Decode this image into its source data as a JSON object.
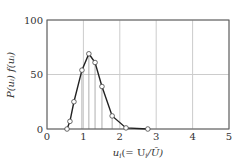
{
  "chart_data": {
    "type": "line",
    "title": "",
    "xlabel": "u_i (= U_i / Ū)",
    "ylabel": "P(u_i) f(u_i)",
    "xlim": [
      0,
      5
    ],
    "ylim": [
      0,
      100
    ],
    "xticks": [
      "0",
      "1",
      "2",
      "3",
      "4",
      "5"
    ],
    "yticks": [
      "0",
      "50",
      "100"
    ],
    "grid": true,
    "legend": null,
    "series": [
      {
        "name": "P(u_i) f(u_i)",
        "marker": "open-circle",
        "x": [
          0.55,
          0.63,
          0.74,
          0.96,
          1.15,
          1.32,
          1.51,
          1.79,
          2.17,
          2.77
        ],
        "y": [
          0,
          7,
          25,
          54,
          69,
          61,
          39,
          12,
          1,
          0
        ]
      }
    ],
    "drop_lines_x": [
      0.96,
      1.15,
      1.32,
      1.51,
      1.79
    ],
    "colors": {
      "frame": "#555555",
      "grid": "#cccccc",
      "line": "#222222",
      "drop": "#999999"
    }
  },
  "labels": {
    "xlabel_main": "u",
    "xlabel_sub": "i",
    "xlabel_rest": "(= U",
    "xlabel_rest_sub": "i",
    "xlabel_end": "/Ū)",
    "ylabel": "P(uᵢ) f(uᵢ)"
  }
}
